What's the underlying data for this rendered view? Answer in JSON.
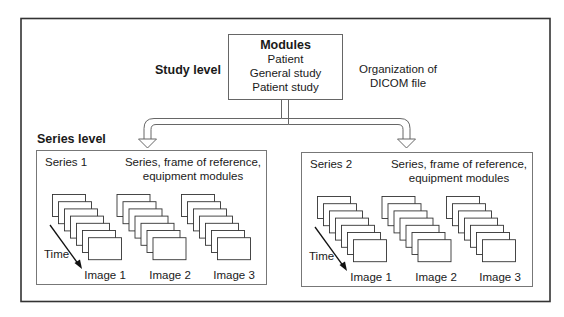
{
  "title": "Organization of DICOM file",
  "caption_lines": [
    "Organization of",
    "DICOM file"
  ],
  "study_level": {
    "label": "Study level",
    "modules_heading": "Modules",
    "modules": [
      "Patient",
      "General study",
      "Patient study"
    ]
  },
  "series_level": {
    "label": "Series level",
    "series": [
      {
        "name": "Series 1",
        "modules_lines": [
          "Series, frame of reference,",
          "equipment modules"
        ],
        "time_label": "Time",
        "images": [
          "Image 1",
          "Image 2",
          "Image 3"
        ],
        "frames_per_image": 7
      },
      {
        "name": "Series 2",
        "modules_lines": [
          "Series, frame of reference,",
          "equipment modules"
        ],
        "time_label": "Time",
        "images": [
          "Image 1",
          "Image 2",
          "Image 3"
        ],
        "frames_per_image": 7
      }
    ]
  },
  "colors": {
    "line": "#555555",
    "frame": "#333333",
    "text": "#1a1a1a"
  }
}
